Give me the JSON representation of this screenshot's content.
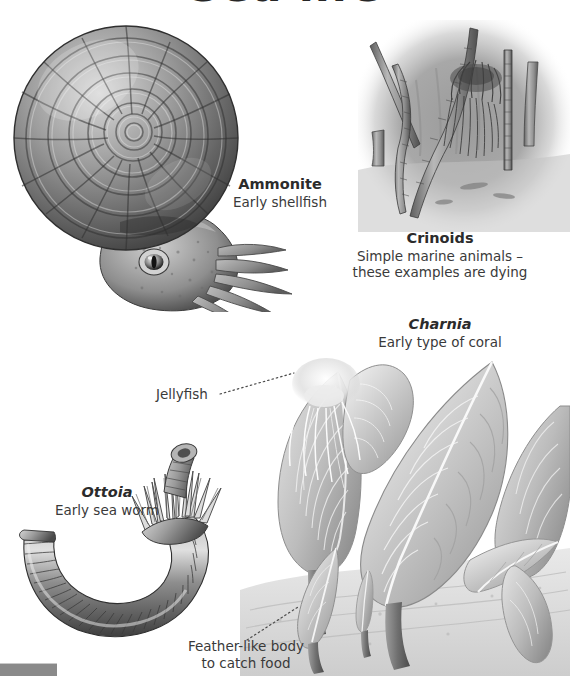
{
  "page": {
    "title": "Sea life",
    "background_color": "#ffffff",
    "text_color": "#333333",
    "width": 570,
    "height": 676
  },
  "figures": [
    {
      "id": "ammonite",
      "name": "Ammonite",
      "description": "Early shellfish",
      "italic_name": false,
      "illustration": "ammonite-spiral-shell-with-tentacled-head"
    },
    {
      "id": "crinoids",
      "name": "Crinoids",
      "description": "Simple marine animals –",
      "description2": "these examples are dying",
      "italic_name": false,
      "illustration": "crinoid-stalks-with-feathery-crown"
    },
    {
      "id": "charnia",
      "name": "Charnia",
      "description": "Early type of coral",
      "italic_name": true,
      "illustration": "charnia-fronds-on-seafloor"
    },
    {
      "id": "ottoia",
      "name": "Ottoia",
      "description": "Early sea worm",
      "italic_name": true,
      "illustration": "segmented-curved-sea-worm-with-spiny-proboscis"
    }
  ],
  "annotations": [
    {
      "id": "jellyfish",
      "label": "Jellyfish",
      "leader": "dotted"
    },
    {
      "id": "feather-body",
      "label": "Feather-like body",
      "label2": "to catch food",
      "leader": "dotted"
    }
  ],
  "decorations": {
    "corner_bar_color": "#8a8a8a"
  }
}
